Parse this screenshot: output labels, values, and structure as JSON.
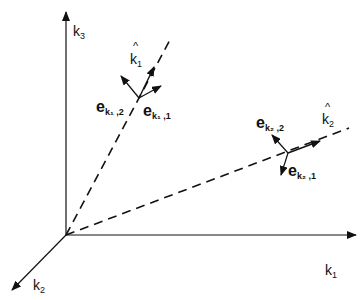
{
  "diagram": {
    "axes": {
      "k3": {
        "label": "k",
        "sub": "3"
      },
      "k1": {
        "label": "k",
        "sub": "1"
      },
      "k2": {
        "label": "k",
        "sub": "2"
      }
    },
    "vectors": {
      "k1hat": {
        "label": "k",
        "sub": "1",
        "hat": "^"
      },
      "k2hat": {
        "label": "k",
        "sub": "2",
        "hat": "^"
      },
      "e_k1_2": {
        "label": "e",
        "sub": "k₁ ,2"
      },
      "e_k1_1": {
        "label": "e",
        "sub": "k₁ ,1"
      },
      "e_k2_2": {
        "label": "e",
        "sub": "k₂ ,2"
      },
      "e_k2_1": {
        "label": "e",
        "sub": "k₂ ,1"
      }
    },
    "colors": {
      "ink": "#111111",
      "background": "#ffffff"
    }
  }
}
